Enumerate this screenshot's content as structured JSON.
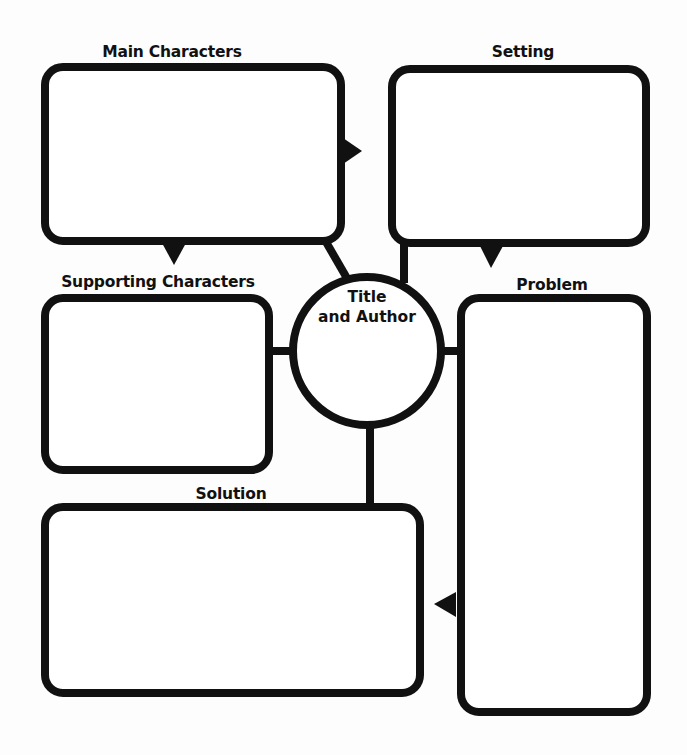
{
  "diagram": {
    "type": "story-map graphic organizer",
    "colors": {
      "stroke": "#111111",
      "fill": "#ffffff",
      "background": "#fdfdfd"
    },
    "nodes": {
      "main_characters": {
        "label": "Main Characters",
        "content": ""
      },
      "setting": {
        "label": "Setting",
        "content": ""
      },
      "supporting_characters": {
        "label": "Supporting Characters",
        "content": ""
      },
      "title_author": {
        "label_line1": "Title",
        "label_line2": "and Author",
        "content": ""
      },
      "problem": {
        "label": "Problem",
        "content": ""
      },
      "solution": {
        "label": "Solution",
        "content": ""
      }
    },
    "edges": [
      {
        "from": "main_characters",
        "to": "setting",
        "type": "arrow"
      },
      {
        "from": "main_characters",
        "to": "supporting_characters",
        "type": "arrow"
      },
      {
        "from": "setting",
        "to": "problem",
        "type": "arrow"
      },
      {
        "from": "problem",
        "to": "solution",
        "type": "arrow"
      },
      {
        "from": "title_author",
        "to": "main_characters",
        "type": "line"
      },
      {
        "from": "title_author",
        "to": "setting",
        "type": "line"
      },
      {
        "from": "title_author",
        "to": "supporting_characters",
        "type": "line"
      },
      {
        "from": "title_author",
        "to": "problem",
        "type": "line"
      },
      {
        "from": "title_author",
        "to": "solution",
        "type": "line"
      }
    ]
  }
}
